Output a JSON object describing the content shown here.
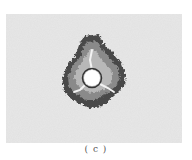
{
  "figure": {
    "panel_label": "( c )",
    "colors": {
      "background_medium": "#dcdcdc",
      "outer_damage": "#4a4a4a",
      "mid_damage": "#8a8a8a",
      "inner_damage": "#bdbdbd",
      "hole": "#ffffff",
      "hole_ring": "#333333"
    },
    "hole": {
      "cx": 86,
      "cy": 64,
      "r": 8
    },
    "radial_cracks": 3
  }
}
